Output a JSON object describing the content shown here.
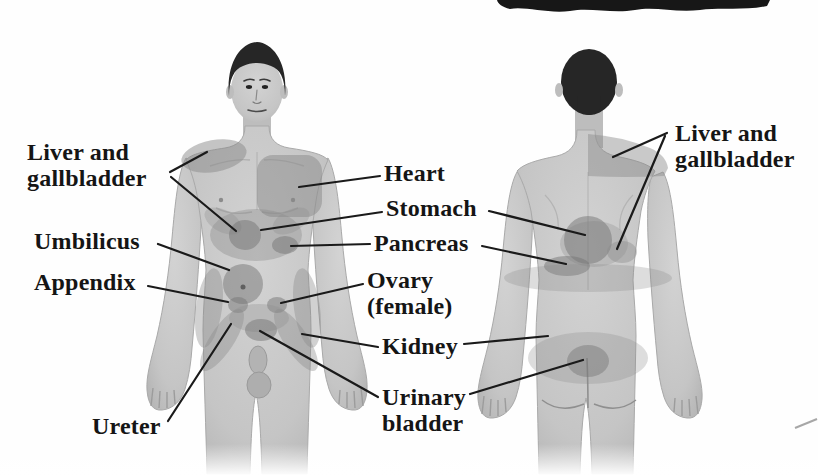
{
  "figure": {
    "type": "anatomical-referred-pain-diagram",
    "views": [
      {
        "name": "anterior-view"
      },
      {
        "name": "posterior-view"
      }
    ],
    "colors": {
      "ink": "#1a1a1a",
      "skin": "#c7c7c7",
      "pain_region": "#8a8a8a",
      "pain_region_dark": "#767676",
      "hair": "#262626",
      "background": "#fefefe"
    }
  },
  "labels": {
    "liver_gallbladder_left": "Liver and\ngallbladder",
    "umbilicus": "Umbilicus",
    "appendix": "Appendix",
    "ureter": "Ureter",
    "heart": "Heart",
    "stomach": "Stomach",
    "pancreas": "Pancreas",
    "ovary_female": "Ovary\n(female)",
    "kidney": "Kidney",
    "urinary_bladder": "Urinary\nbladder",
    "liver_gallbladder_right": "Liver and\ngallbladder"
  }
}
